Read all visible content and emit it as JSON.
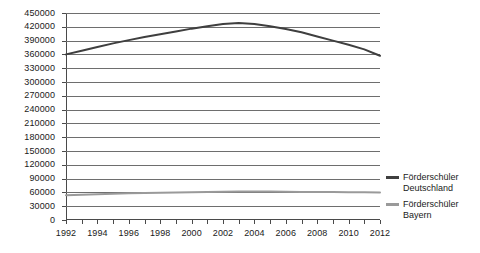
{
  "chart_data": {
    "type": "line",
    "title": "",
    "xlabel": "",
    "ylabel": "",
    "grid": true,
    "legend_position": "right",
    "x": [
      1992,
      1993,
      1994,
      1995,
      1996,
      1997,
      1998,
      1999,
      2000,
      2001,
      2002,
      2003,
      2004,
      2005,
      2006,
      2007,
      2008,
      2009,
      2010,
      2011,
      2012
    ],
    "xlim": [
      1992,
      2012
    ],
    "ylim": [
      0,
      450000
    ],
    "ytick_step": 30000,
    "yticks": [
      450000,
      420000,
      390000,
      360000,
      330000,
      300000,
      270000,
      240000,
      210000,
      180000,
      150000,
      120000,
      90000,
      60000,
      30000,
      0
    ],
    "ytick_labels": [
      "450000",
      "420000",
      "390000",
      "360000",
      "330000",
      "300000",
      "270000",
      "240000",
      "210000",
      "180000",
      "150000",
      "120000",
      "90000",
      "60000",
      "30000",
      "0"
    ],
    "xtick_labels": [
      "1992",
      "1994",
      "1996",
      "1998",
      "2000",
      "2002",
      "2004",
      "2006",
      "2008",
      "2010",
      "2012"
    ],
    "xtick_label_years": [
      1992,
      1994,
      1996,
      1998,
      2000,
      2002,
      2004,
      2006,
      2008,
      2010,
      2012
    ],
    "series": [
      {
        "name": "Förderschüler Deutschland",
        "legend_line1": "Förderschüler",
        "legend_line2": "Deutschland",
        "color": "#3f3f3f",
        "values": [
          360000,
          368000,
          376000,
          384000,
          391000,
          398000,
          404000,
          410000,
          416000,
          421000,
          426000,
          428000,
          426000,
          421000,
          415000,
          408000,
          399000,
          390000,
          381000,
          371000,
          357000
        ]
      },
      {
        "name": "Förderschüler Bayern",
        "legend_line1": "Förderschüler",
        "legend_line2": "Bayern",
        "color": "#9a9a9a",
        "values": [
          54000,
          55000,
          56000,
          57000,
          58000,
          58500,
          59000,
          60000,
          60500,
          61000,
          61500,
          62000,
          62000,
          62000,
          61500,
          61000,
          61000,
          61000,
          60500,
          60500,
          60000
        ]
      }
    ]
  }
}
